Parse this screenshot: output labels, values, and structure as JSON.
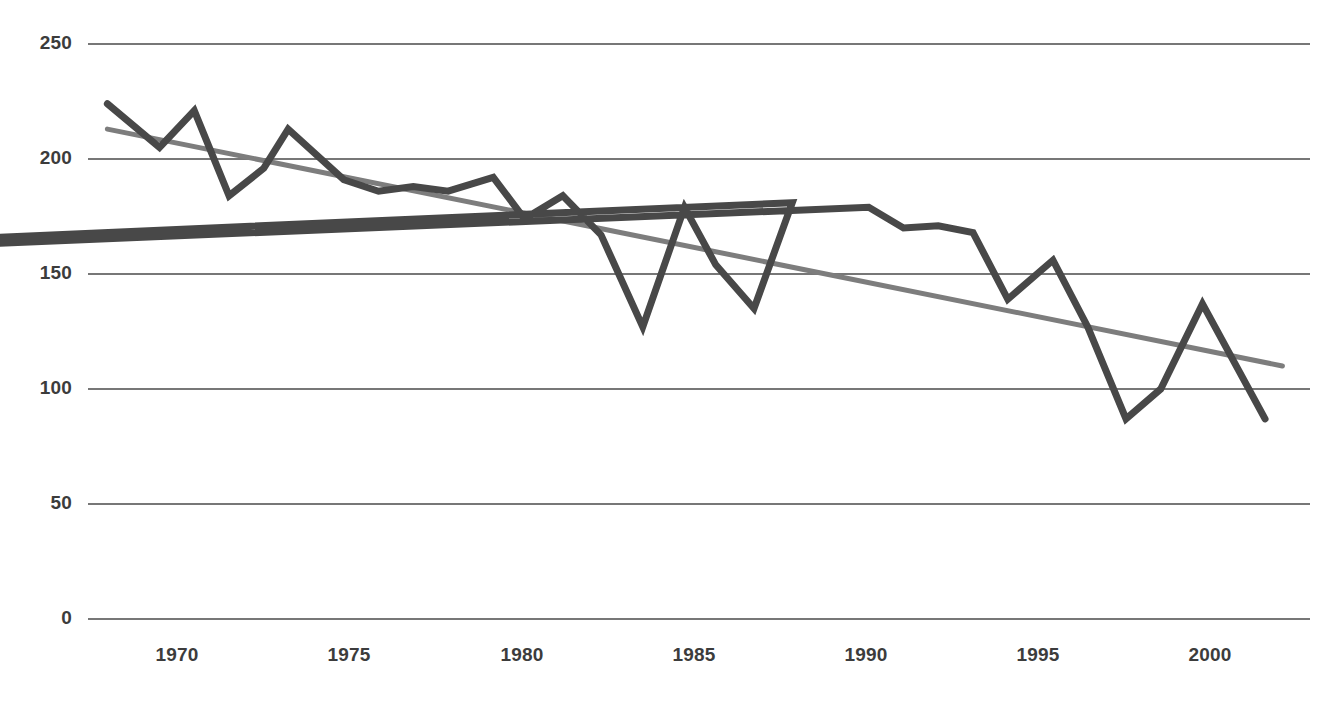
{
  "chart_data": {
    "type": "line",
    "title": "",
    "subtitle": "",
    "xlabel": "",
    "ylabel": "",
    "xlim": [
      1967.5,
      2001.5
    ],
    "ylim": [
      0,
      250
    ],
    "grid": true,
    "grid_axis": "y",
    "legend": false,
    "legend_position": "none",
    "x_ticks": [
      1970,
      1975,
      1980,
      1985,
      1990,
      1995,
      2000
    ],
    "y_ticks": [
      0,
      50,
      100,
      150,
      200,
      250
    ],
    "x_tick_labels": [
      "1970",
      "1975",
      "1980",
      "1985",
      "1990",
      "1995",
      "2000"
    ],
    "y_tick_labels": [
      "0",
      "50",
      "100",
      "150",
      "200",
      "250"
    ],
    "x": [
      1968,
      1969,
      1970,
      1971,
      1972,
      1973,
      1974,
      1975,
      1976,
      1977,
      1978,
      1979,
      1980,
      1981,
      1982,
      1983,
      1984,
      1985,
      1986,
      1987,
      1988,
      1989,
      1990,
      1991,
      1992,
      1993,
      1994,
      1995,
      1996,
      1997,
      1998,
      1999,
      2000,
      2001
    ],
    "series": [
      {
        "name": "Observed series",
        "color": "#484848",
        "width": 7,
        "values": [
          224,
          205,
          221,
          184,
          196,
          213,
          204,
          187,
          186,
          188,
          186,
          192,
          174,
          184,
          167,
          127,
          179,
          154,
          135,
          181,
          116,
          179,
          170,
          171,
          168,
          139,
          156,
          127,
          87,
          100,
          137,
          87,
          87,
          87
        ]
      },
      {
        "name": "Linear trend",
        "color": "#7d7d7d",
        "width": 5,
        "values": [
          212,
          209,
          206,
          203,
          200,
          197,
          194,
          191,
          188,
          185,
          182,
          179,
          176,
          173,
          170,
          167,
          164,
          161,
          158,
          155,
          152,
          149,
          146,
          143,
          140,
          137,
          134,
          131,
          128,
          125,
          122,
          119,
          116,
          113
        ]
      }
    ],
    "data_points": [
      {
        "x": 1968.0,
        "y": 224
      },
      {
        "x": 1969.5,
        "y": 205
      },
      {
        "x": 1970.5,
        "y": 221
      },
      {
        "x": 1971.5,
        "y": 184
      },
      {
        "x": 1972.5,
        "y": 196
      },
      {
        "x": 1973.2,
        "y": 213
      },
      {
        "x": 1974.8,
        "y": 191
      },
      {
        "x": 1975.8,
        "y": 186
      },
      {
        "x": 1976.8,
        "y": 188
      },
      {
        "x": 1977.8,
        "y": 186
      },
      {
        "x": 1979.1,
        "y": 192
      },
      {
        "x": 1980.0,
        "y": 174
      },
      {
        "x": 1981.1,
        "y": 184
      },
      {
        "x": 1982.2,
        "y": 167
      },
      {
        "x": 1983.4,
        "y": 127
      },
      {
        "x": 1984.6,
        "y": 179
      },
      {
        "x": 1985.5,
        "y": 154
      },
      {
        "x": 1986.6,
        "y": 135
      },
      {
        "x": 1987.7,
        "y": 181
      },
      {
        "x": 1888.9,
        "y": 116
      },
      {
        "x": 1989.9,
        "y": 179
      },
      {
        "x": 1990.9,
        "y": 170
      },
      {
        "x": 1991.9,
        "y": 171
      },
      {
        "x": 1992.9,
        "y": 168
      },
      {
        "x": 1993.9,
        "y": 139
      },
      {
        "x": 1995.2,
        "y": 156
      },
      {
        "x": 1996.2,
        "y": 127
      },
      {
        "x": 1997.3,
        "y": 87
      },
      {
        "x": 1998.3,
        "y": 100
      },
      {
        "x": 1999.5,
        "y": 137
      },
      {
        "x": 2001.3,
        "y": 87
      }
    ],
    "trend_endpoints": [
      {
        "x": 1968.0,
        "y": 213
      },
      {
        "x": 2001.8,
        "y": 110
      }
    ],
    "colors": {
      "series_line": "#484848",
      "trend_line": "#7d7d7d",
      "gridline": "#4a4a4a",
      "tick_label": "#3c3c3c",
      "background": "#ffffff"
    }
  },
  "axis": {
    "y_labels": [
      "250",
      "200",
      "150",
      "100",
      "50",
      "0"
    ],
    "x_labels": [
      "1970",
      "1975",
      "1980",
      "1985",
      "1990",
      "1995",
      "2000"
    ]
  }
}
